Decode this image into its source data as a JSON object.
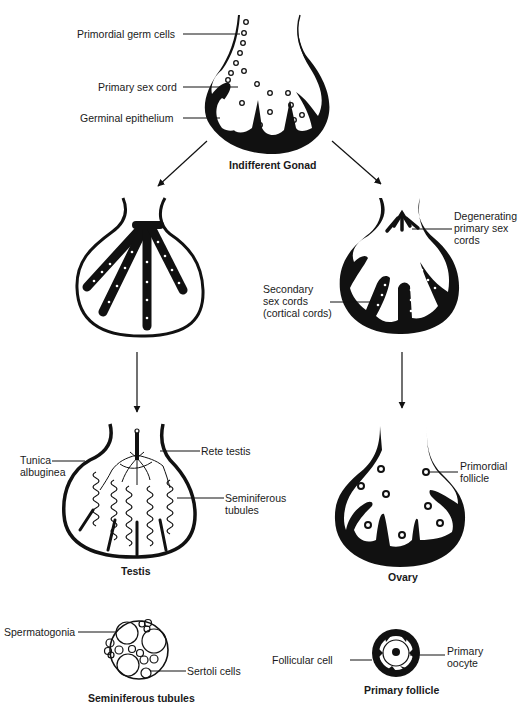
{
  "colors": {
    "ink": "#111111",
    "background": "#ffffff"
  },
  "indifferent_gonad": {
    "title": "Indifferent Gonad",
    "labels": {
      "primordial_germ_cells": "Primordial germ cells",
      "primary_sex_cord": "Primary sex cord",
      "germinal_epithelium": "Germinal epithelium"
    }
  },
  "male_intermediate": {},
  "female_intermediate": {
    "labels": {
      "degenerating_line1": "Degenerating",
      "degenerating_line2": "primary sex",
      "degenerating_line3": "cords",
      "secondary_line1": "Secondary",
      "secondary_line2": "sex cords",
      "secondary_line3": "(cortical cords)"
    }
  },
  "testis": {
    "title": "Testis",
    "labels": {
      "tunica_line1": "Tunica",
      "tunica_line2": "albuginea",
      "rete_testis": "Rete testis",
      "seminiferous_line1": "Seminiferous",
      "seminiferous_line2": "tubules"
    }
  },
  "ovary": {
    "title": "Ovary",
    "labels": {
      "primordial_line1": "Primordial",
      "primordial_line2": "follicle"
    }
  },
  "seminiferous_tubules": {
    "title": "Seminiferous tubules",
    "labels": {
      "spermatogonia": "Spermatogonia",
      "sertoli_cells": "Sertoli cells"
    }
  },
  "primary_follicle": {
    "title": "Primary follicle",
    "labels": {
      "follicular_cell": "Follicular cell",
      "primary_line1": "Primary",
      "primary_line2": "oocyte"
    }
  }
}
